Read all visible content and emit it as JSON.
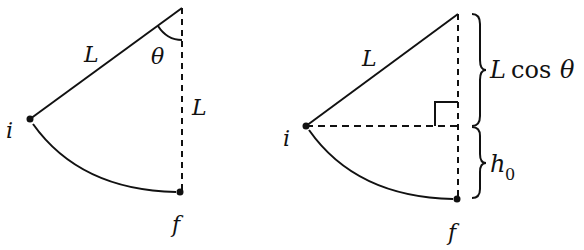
{
  "figure": {
    "left_panel": {
      "labels": {
        "rod_length": "L",
        "vertical_length": "L",
        "angle": "θ",
        "initial_point": "i",
        "final_point": "f"
      },
      "points": {
        "pivot": [
          182,
          8
        ],
        "initial": [
          30,
          119
        ],
        "final": [
          180,
          192
        ]
      }
    },
    "right_panel": {
      "labels": {
        "rod_length": "L",
        "initial_point": "i",
        "final_point": "f",
        "upper_brace": "L cos θ",
        "upper_brace_L": "L",
        "upper_brace_cos": "cos",
        "upper_brace_theta": "θ",
        "lower_brace_h": "h",
        "lower_brace_sub": "0"
      },
      "points": {
        "pivot": [
          458,
          14
        ],
        "initial": [
          306,
          126
        ],
        "final": [
          457,
          199
        ]
      },
      "right_angle_marker": true
    },
    "colors": {
      "stroke": "#111111",
      "background": "#ffffff"
    }
  }
}
